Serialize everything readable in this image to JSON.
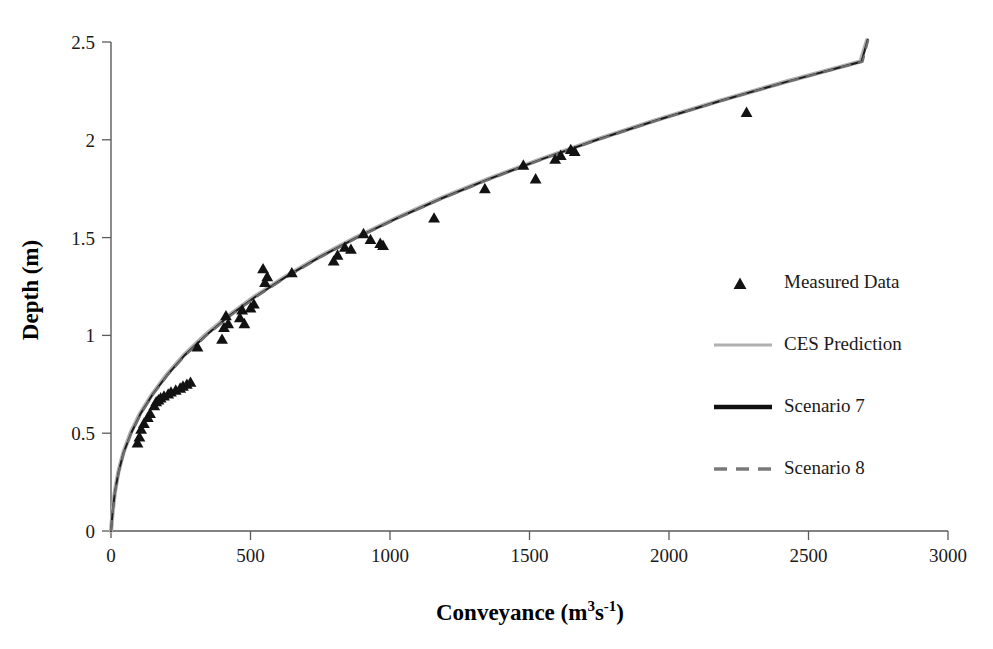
{
  "chart_data": {
    "type": "scatter",
    "title": "",
    "xlabel": "Conveyance (m3s-1)",
    "xlabel_parts": {
      "text": "Conveyance (m",
      "sup1": "3",
      "mid": "s",
      "sup2": "-1",
      "tail": ")"
    },
    "ylabel": "Depth (m)",
    "xlim": [
      0,
      3000
    ],
    "ylim": [
      0,
      2.5
    ],
    "xticks": [
      0,
      500,
      1000,
      1500,
      2000,
      2500,
      3000
    ],
    "xtick_labels": [
      "0",
      "500",
      "1000",
      "1500",
      "2000",
      "2500",
      "3000"
    ],
    "yticks": [
      0,
      0.5,
      1,
      1.5,
      2,
      2.5
    ],
    "ytick_labels": [
      "0",
      "0.5",
      "1",
      "1.5",
      "2",
      "2.5"
    ],
    "grid": false,
    "legend_position": "right",
    "series": [
      {
        "name": "Measured Data",
        "type": "scatter",
        "marker": "triangle",
        "color": "#121212",
        "points": [
          [
            95,
            0.45
          ],
          [
            102,
            0.48
          ],
          [
            108,
            0.52
          ],
          [
            118,
            0.55
          ],
          [
            132,
            0.58
          ],
          [
            140,
            0.6
          ],
          [
            155,
            0.64
          ],
          [
            162,
            0.66
          ],
          [
            170,
            0.67
          ],
          [
            178,
            0.68
          ],
          [
            190,
            0.69
          ],
          [
            205,
            0.7
          ],
          [
            215,
            0.71
          ],
          [
            232,
            0.72
          ],
          [
            248,
            0.73
          ],
          [
            258,
            0.74
          ],
          [
            272,
            0.75
          ],
          [
            285,
            0.76
          ],
          [
            310,
            0.94
          ],
          [
            398,
            0.98
          ],
          [
            405,
            1.04
          ],
          [
            412,
            1.1
          ],
          [
            420,
            1.06
          ],
          [
            462,
            1.09
          ],
          [
            470,
            1.13
          ],
          [
            478,
            1.06
          ],
          [
            500,
            1.14
          ],
          [
            512,
            1.16
          ],
          [
            545,
            1.34
          ],
          [
            552,
            1.27
          ],
          [
            560,
            1.3
          ],
          [
            648,
            1.32
          ],
          [
            798,
            1.38
          ],
          [
            812,
            1.41
          ],
          [
            838,
            1.45
          ],
          [
            860,
            1.44
          ],
          [
            905,
            1.52
          ],
          [
            930,
            1.49
          ],
          [
            965,
            1.47
          ],
          [
            975,
            1.46
          ],
          [
            1158,
            1.6
          ],
          [
            1340,
            1.75
          ],
          [
            1478,
            1.87
          ],
          [
            1522,
            1.8
          ],
          [
            1592,
            1.9
          ],
          [
            1612,
            1.92
          ],
          [
            1648,
            1.95
          ],
          [
            1662,
            1.94
          ],
          [
            2278,
            2.14
          ]
        ]
      },
      {
        "name": "CES Prediction",
        "type": "line",
        "style": "solid",
        "color": "#b0b0b0",
        "points": [
          [
            0,
            0.0
          ],
          [
            6,
            0.1
          ],
          [
            14,
            0.2
          ],
          [
            26,
            0.3
          ],
          [
            44,
            0.4
          ],
          [
            70,
            0.5
          ],
          [
            104,
            0.6
          ],
          [
            148,
            0.7
          ],
          [
            200,
            0.8
          ],
          [
            262,
            0.9
          ],
          [
            336,
            1.0
          ],
          [
            420,
            1.1
          ],
          [
            516,
            1.2
          ],
          [
            624,
            1.3
          ],
          [
            744,
            1.4
          ],
          [
            876,
            1.5
          ],
          [
            1022,
            1.6
          ],
          [
            1180,
            1.7
          ],
          [
            1352,
            1.8
          ],
          [
            1538,
            1.9
          ],
          [
            1738,
            2.0
          ],
          [
            1952,
            2.1
          ],
          [
            2182,
            2.2
          ],
          [
            2426,
            2.3
          ],
          [
            2686,
            2.4
          ],
          [
            2710,
            2.51
          ]
        ]
      },
      {
        "name": "Scenario 7",
        "type": "line",
        "style": "solid",
        "color": "#1c1c1c",
        "points": [
          [
            0,
            0.0
          ],
          [
            6,
            0.1
          ],
          [
            14,
            0.2
          ],
          [
            27,
            0.3
          ],
          [
            45,
            0.4
          ],
          [
            72,
            0.5
          ],
          [
            106,
            0.6
          ],
          [
            150,
            0.7
          ],
          [
            203,
            0.8
          ],
          [
            265,
            0.9
          ],
          [
            340,
            1.0
          ],
          [
            424,
            1.1
          ],
          [
            520,
            1.2
          ],
          [
            628,
            1.3
          ],
          [
            748,
            1.4
          ],
          [
            880,
            1.5
          ],
          [
            1026,
            1.6
          ],
          [
            1184,
            1.7
          ],
          [
            1356,
            1.8
          ],
          [
            1542,
            1.9
          ],
          [
            1742,
            2.0
          ],
          [
            1956,
            2.1
          ],
          [
            2186,
            2.2
          ],
          [
            2430,
            2.3
          ],
          [
            2690,
            2.4
          ],
          [
            2712,
            2.51
          ]
        ]
      },
      {
        "name": "Scenario 8",
        "type": "line",
        "style": "dashed",
        "color": "#6e6e6e",
        "points": [
          [
            0,
            0.0
          ],
          [
            6,
            0.1
          ],
          [
            15,
            0.2
          ],
          [
            28,
            0.3
          ],
          [
            46,
            0.4
          ],
          [
            73,
            0.5
          ],
          [
            108,
            0.6
          ],
          [
            152,
            0.7
          ],
          [
            205,
            0.8
          ],
          [
            268,
            0.9
          ],
          [
            343,
            1.0
          ],
          [
            428,
            1.1
          ],
          [
            524,
            1.2
          ],
          [
            632,
            1.3
          ],
          [
            752,
            1.4
          ],
          [
            884,
            1.5
          ],
          [
            1030,
            1.6
          ],
          [
            1188,
            1.7
          ],
          [
            1360,
            1.8
          ],
          [
            1546,
            1.9
          ],
          [
            1746,
            2.0
          ],
          [
            1960,
            2.1
          ],
          [
            2190,
            2.2
          ],
          [
            2434,
            2.3
          ],
          [
            2694,
            2.4
          ],
          [
            2714,
            2.51
          ]
        ]
      }
    ]
  },
  "legend": {
    "items": [
      {
        "label": "Measured Data",
        "kind": "marker"
      },
      {
        "label": "CES Prediction",
        "kind": "line-solid-gray"
      },
      {
        "label": "Scenario 7",
        "kind": "line-solid-black"
      },
      {
        "label": "Scenario 8",
        "kind": "line-dashed-gray"
      }
    ]
  }
}
